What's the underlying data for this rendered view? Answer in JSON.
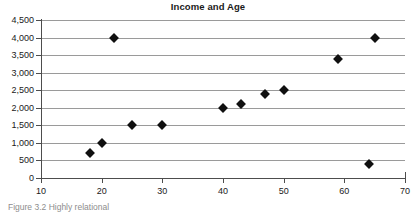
{
  "chart_data": {
    "type": "scatter",
    "title": "Income and Age",
    "xlabel": "",
    "ylabel": "",
    "xlim": [
      10,
      70
    ],
    "ylim": [
      0,
      4500
    ],
    "grid": "horizontal",
    "legend": "none",
    "marker": "diamond",
    "marker_color": "#101010",
    "series": [
      {
        "name": "Income and Age",
        "points": [
          {
            "x": 18,
            "y": 700
          },
          {
            "x": 20,
            "y": 1000
          },
          {
            "x": 22,
            "y": 4000
          },
          {
            "x": 25,
            "y": 1500
          },
          {
            "x": 30,
            "y": 1500
          },
          {
            "x": 40,
            "y": 2000
          },
          {
            "x": 43,
            "y": 2100
          },
          {
            "x": 47,
            "y": 2400
          },
          {
            "x": 50,
            "y": 2500
          },
          {
            "x": 59,
            "y": 3400
          },
          {
            "x": 64,
            "y": 400
          },
          {
            "x": 65,
            "y": 4000
          }
        ]
      }
    ],
    "x_ticks": [
      {
        "value": 10,
        "label": "10"
      },
      {
        "value": 20,
        "label": "20"
      },
      {
        "value": 30,
        "label": "30"
      },
      {
        "value": 40,
        "label": "40"
      },
      {
        "value": 50,
        "label": "50"
      },
      {
        "value": 60,
        "label": "60"
      },
      {
        "value": 70,
        "label": "70"
      }
    ],
    "y_ticks": [
      {
        "value": 4500,
        "label": "4,500"
      },
      {
        "value": 4000,
        "label": "4,000"
      },
      {
        "value": 3500,
        "label": "3,500"
      },
      {
        "value": 3000,
        "label": "3,000"
      },
      {
        "value": 2500,
        "label": "2,500"
      },
      {
        "value": 2000,
        "label": "2,000"
      },
      {
        "value": 1500,
        "label": "1,500"
      },
      {
        "value": 1000,
        "label": "1,000"
      },
      {
        "value": 500,
        "label": "500"
      },
      {
        "value": 0,
        "label": "0"
      }
    ]
  },
  "colors": {
    "marker": "#101010",
    "gridline": "#9a9a9a",
    "axis": "#4d4d4d",
    "text": "#1a1a1a",
    "caption": "#8d8d8d"
  },
  "caption": {
    "text": "Figure 3.2  Highly relational"
  }
}
